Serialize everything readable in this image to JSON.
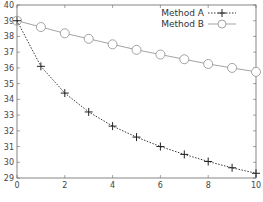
{
  "chart_data": {
    "type": "line",
    "title": "",
    "xlabel": "",
    "ylabel": "",
    "xlim": [
      0,
      10
    ],
    "ylim": [
      29,
      40
    ],
    "x_ticks": [
      "0",
      "2",
      "4",
      "6",
      "8",
      "10"
    ],
    "y_ticks": [
      "29",
      "30",
      "31",
      "32",
      "33",
      "34",
      "35",
      "36",
      "37",
      "38",
      "39",
      "40"
    ],
    "grid": false,
    "legend_position": "upper right",
    "x": [
      0,
      1,
      2,
      3,
      4,
      5,
      6,
      7,
      8,
      9,
      10
    ],
    "series": [
      {
        "name": "Method A",
        "style": "dotted line with plus markers",
        "color": "#222222",
        "values": [
          39.0,
          36.1,
          34.4,
          33.2,
          32.3,
          31.6,
          31.0,
          30.5,
          30.05,
          29.65,
          29.3
        ]
      },
      {
        "name": "Method B",
        "style": "solid line with hollow circle markers",
        "color": "#999999",
        "values": [
          39.0,
          38.6,
          38.2,
          37.85,
          37.5,
          37.15,
          36.85,
          36.55,
          36.25,
          36.0,
          35.75
        ]
      }
    ]
  },
  "legend": {
    "method_a": "Method A",
    "method_b": "Method B"
  }
}
